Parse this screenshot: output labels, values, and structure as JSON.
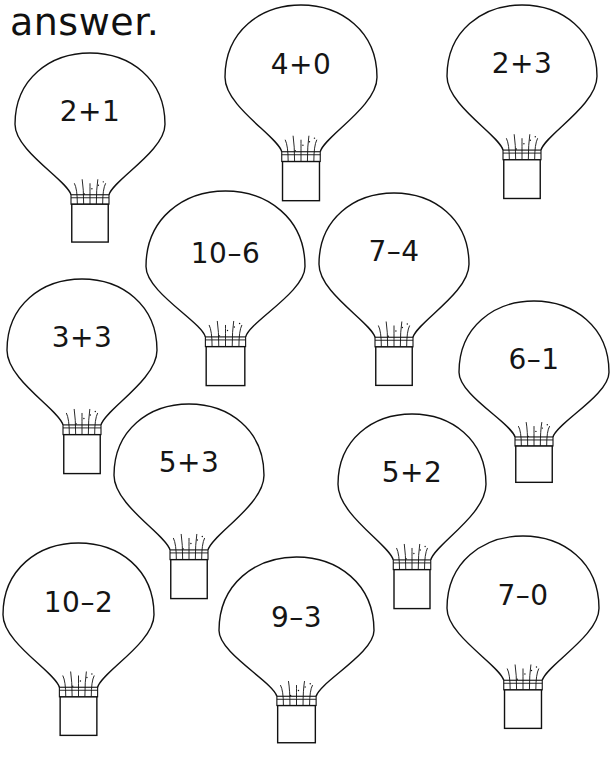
{
  "worksheet": {
    "heading": "answer.",
    "stroke_color": "#111111",
    "background_color": "#ffffff",
    "balloons": [
      {
        "problem": "2+1",
        "x": 14,
        "y": 52,
        "w": 152,
        "h": 172
      },
      {
        "problem": "4+0",
        "x": 224,
        "y": 4,
        "w": 154,
        "h": 178
      },
      {
        "problem": "2+3",
        "x": 446,
        "y": 4,
        "w": 152,
        "h": 176
      },
      {
        "problem": "10–6",
        "x": 145,
        "y": 190,
        "w": 161,
        "h": 177
      },
      {
        "problem": "7–4",
        "x": 318,
        "y": 192,
        "w": 152,
        "h": 175
      },
      {
        "problem": "3+3",
        "x": 6,
        "y": 278,
        "w": 152,
        "h": 177
      },
      {
        "problem": "6–1",
        "x": 458,
        "y": 300,
        "w": 152,
        "h": 165
      },
      {
        "problem": "5+3",
        "x": 113,
        "y": 403,
        "w": 152,
        "h": 177
      },
      {
        "problem": "5+2",
        "x": 337,
        "y": 413,
        "w": 150,
        "h": 177
      },
      {
        "problem": "10–2",
        "x": 2,
        "y": 542,
        "w": 153,
        "h": 175
      },
      {
        "problem": "9–3",
        "x": 218,
        "y": 556,
        "w": 157,
        "h": 169
      },
      {
        "problem": "7–0",
        "x": 446,
        "y": 535,
        "w": 154,
        "h": 175
      }
    ]
  }
}
